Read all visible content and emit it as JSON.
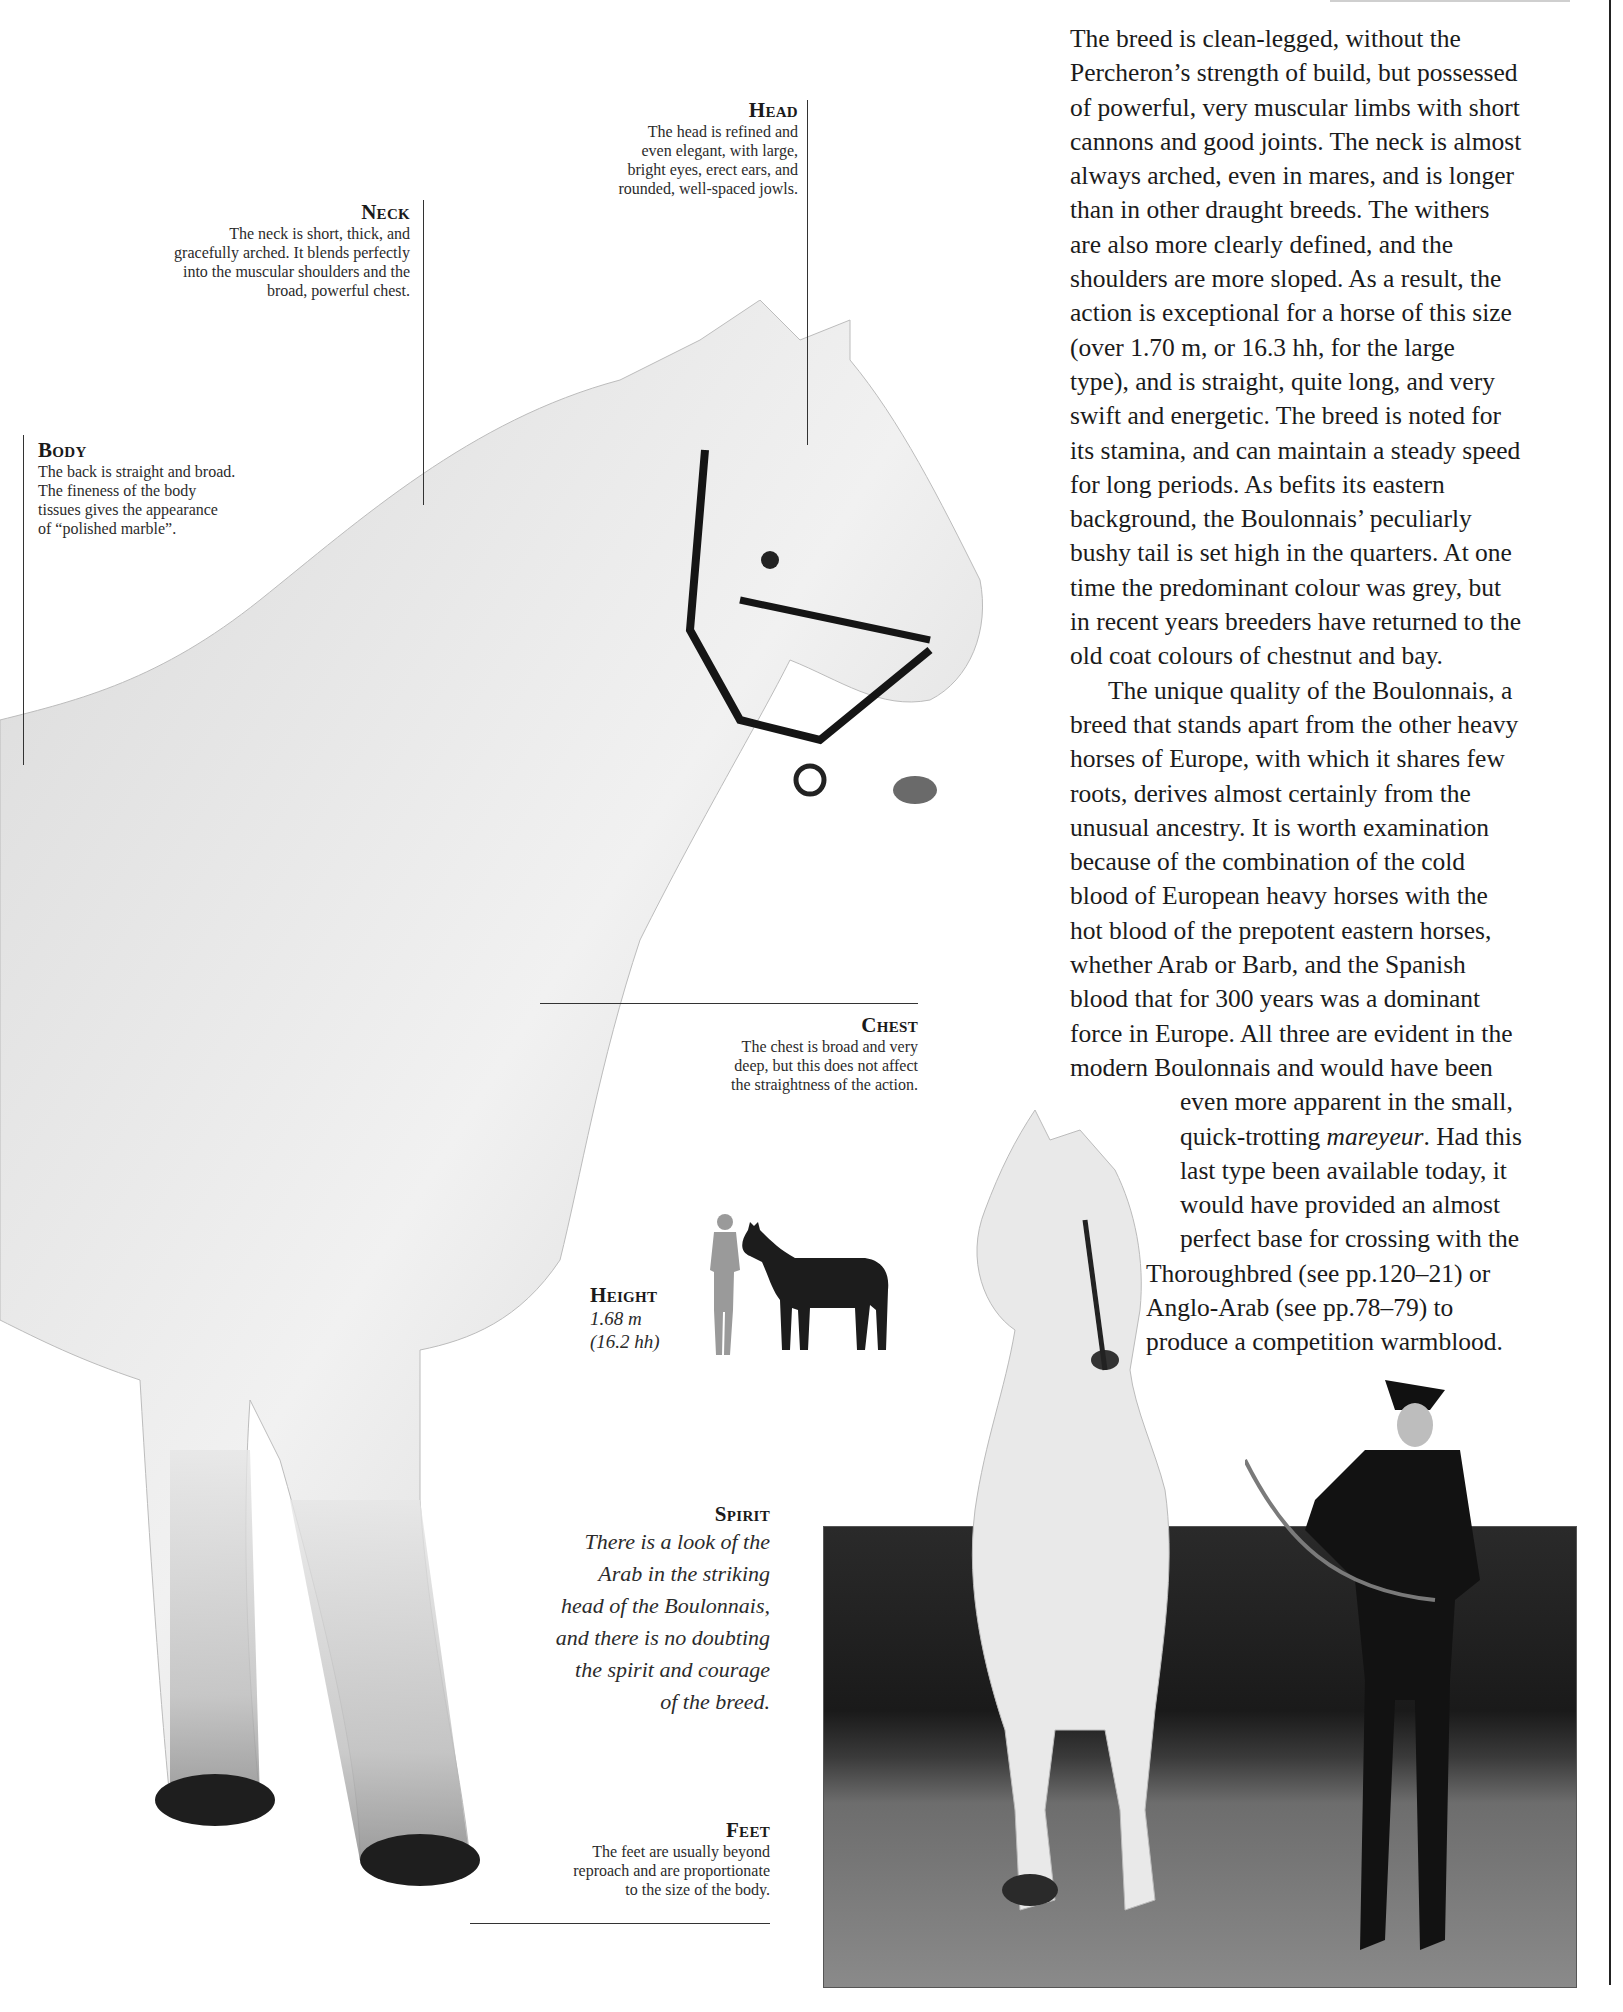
{
  "page": {
    "type": "reference-book-spread"
  },
  "callouts": {
    "head": {
      "title": "Head",
      "lines": [
        "The head is refined and",
        "even elegant, with large,",
        "bright eyes, erect ears, and",
        "rounded, well-spaced jowls."
      ]
    },
    "neck": {
      "title": "Neck",
      "lines": [
        "The neck is short, thick, and",
        "gracefully arched. It blends perfectly",
        "into the muscular shoulders and the",
        "broad, powerful chest."
      ]
    },
    "body": {
      "title": "Body",
      "lines": [
        "The back is straight and broad.",
        "The fineness of the body",
        "tissues gives the appearance",
        "of “polished marble”."
      ]
    },
    "chest": {
      "title": "Chest",
      "lines": [
        "The chest is broad and very",
        "deep, but this does not affect",
        "the straightness of the action."
      ]
    },
    "height": {
      "title": "Height",
      "metric": "1.68 m",
      "hands": "(16.2 hh)"
    },
    "spirit": {
      "title": "Spirit",
      "lines": [
        "There is a look of the",
        "Arab in the striking",
        "head of the Boulonnais,",
        "and there is no doubting",
        "the spirit and courage",
        "of the breed."
      ]
    },
    "feet": {
      "title": "Feet",
      "lines": [
        "The feet are usually beyond",
        "reproach and are proportionate",
        "to the size of the body."
      ]
    }
  },
  "article": {
    "paragraph1": [
      "The breed is clean-legged, without the",
      "Percheron’s strength of build, but possessed",
      "of powerful, very muscular limbs with short",
      "cannons and good joints. The neck is almost",
      "always arched, even in mares, and is longer",
      "than in other draught breeds. The withers",
      "are also more clearly defined, and the",
      "shoulders are more sloped. As a result, the",
      "action is exceptional for a horse of this size",
      "(over 1.70 m, or 16.3 hh, for the large",
      "type), and is straight, quite long, and very",
      "swift and energetic. The breed is noted for",
      "its stamina, and can maintain a steady speed",
      "for long periods. As befits its eastern",
      "background, the Boulonnais’ peculiarly",
      "bushy tail is set high in the quarters. At one",
      "time the predominant colour was grey, but",
      "in recent years breeders have returned to the",
      "old coat colours of chestnut and bay."
    ],
    "paragraph2": [
      "The unique quality of the Boulonnais, a",
      "breed that stands apart from the other heavy",
      "horses of Europe, with which it shares few",
      "roots, derives almost certainly from the",
      "unusual ancestry. It is worth examination",
      "because of the combination of the cold",
      "blood of European heavy horses with the",
      "hot blood of the prepotent eastern horses,",
      "whether Arab or Barb, and the Spanish",
      "blood that for 300 years was a dominant",
      "force in Europe. All three are evident in the",
      "modern Boulonnais and would have been"
    ],
    "paragraph2_inset": [
      "even more apparent in the small,",
      "quick-trotting ",
      "mareyeur",
      ". Had this",
      "last type been available today, it",
      "would have provided an almost",
      "perfect base for crossing with the"
    ],
    "paragraph2_tail": [
      "Thoroughbred (see pp.120–21) or",
      "Anglo-Arab (see pp.78–79) to",
      "produce a competition warmblood."
    ]
  },
  "images": {
    "main_photo": "white-grey-boulonnais-horse-standing-profile-with-black-halter",
    "height_figure": "grey-human-silhouette-beside-black-horse-silhouette",
    "action_photo": "grey-horse-rearing-led-by-uniformed-handler-on-gravel"
  },
  "colors": {
    "page_bg": "#ffffff",
    "text": "#1b1b1b",
    "rule": "#333333",
    "horse_coat": "#e6e6e6",
    "silhouette_human": "#9a9a9a",
    "silhouette_horse": "#1c1c1c"
  }
}
